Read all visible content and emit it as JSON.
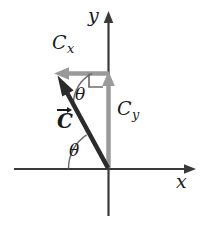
{
  "figure": {
    "background_color": "#ffffff",
    "width": 210,
    "height": 225
  },
  "axes": {
    "x_label": "x",
    "y_label": "y",
    "axis_color": "#3a3a3a",
    "origin": {
      "x": 108,
      "y": 168
    },
    "x_axis": {
      "start_x": 14,
      "end_x": 196,
      "y": 169
    },
    "y_axis": {
      "x": 108.5,
      "top_y": 11,
      "bottom_y": 216
    }
  },
  "labels": {
    "cx": {
      "base": "C",
      "subscript": "x"
    },
    "cy": {
      "base": "C",
      "subscript": "y"
    },
    "c_vector": "C",
    "theta_upper": "θ",
    "theta_lower": "θ"
  },
  "vectors": {
    "resultant": {
      "name": "C",
      "color": "#2b2b2b",
      "tail": {
        "x": 108,
        "y": 168
      },
      "tip": {
        "x": 58,
        "y": 76
      },
      "stroke_width": 4
    },
    "x_component": {
      "name": "Cx",
      "color": "#9a9a9a",
      "tail": {
        "x": 108,
        "y": 73
      },
      "tip": {
        "x": 55,
        "y": 73
      },
      "stroke_width": 4,
      "direction": "left"
    },
    "y_component": {
      "name": "Cy",
      "color": "#9a9a9a",
      "tail": {
        "x": 108.5,
        "y": 168
      },
      "tip": {
        "x": 108.5,
        "y": 73
      },
      "stroke_width": 4,
      "direction": "up"
    }
  },
  "annotations": {
    "right_angle_marker": {
      "corner": {
        "x": 103,
        "y": 73
      },
      "size": 14,
      "color": "#6e6e6e"
    },
    "theta_arc_upper": {
      "center": {
        "x": 58,
        "y": 76
      },
      "radius": 34,
      "color": "#6e6e6e"
    },
    "theta_arc_lower": {
      "center": {
        "x": 108,
        "y": 168
      },
      "radius": 40,
      "color": "#6e6e6e"
    }
  },
  "colors": {
    "vector_dark": "#2b2b2b",
    "component_gray": "#9a9a9a",
    "arc_gray": "#6e6e6e",
    "axis": "#3a3a3a",
    "text": "#1a1a1a"
  }
}
